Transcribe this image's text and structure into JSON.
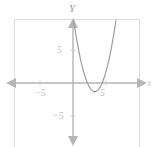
{
  "figure": {
    "kind": "coordinate-plane-parabola",
    "frame_color": "#dcdcdc",
    "axis_color": "#b5b5b5",
    "curve_color": "#9e9e9e",
    "label_color": "#c2c2c2",
    "background": "#ffffff"
  },
  "axes": {
    "y_axis_name": "Y",
    "x_axis_name": "x",
    "x_ticks": [
      {
        "value": -5,
        "label": "−5"
      },
      {
        "value": 5,
        "label": "5"
      }
    ],
    "y_ticks": [
      {
        "value": -5,
        "label": "−5"
      },
      {
        "value": 5,
        "label": "5"
      }
    ]
  },
  "chart_data": {
    "type": "line",
    "title": "",
    "xlabel": "x",
    "ylabel": "Y",
    "xlim": [
      -9,
      11
    ],
    "ylim": [
      -9.5,
      9.5
    ],
    "grid": false,
    "legend": null,
    "series": [
      {
        "name": "parabola",
        "equation": "y = 1.05(x - 3.3)^2 - 1.3",
        "vertex": [
          3.3,
          -1.3
        ],
        "opens": "up",
        "x": [
          0.0,
          0.4,
          0.8,
          1.2,
          1.6,
          2.0,
          2.4,
          2.8,
          3.3,
          3.8,
          4.2,
          4.6,
          5.0,
          5.4,
          5.8,
          6.2,
          6.6
        ],
        "y": [
          10.13,
          8.21,
          6.49,
          4.98,
          3.67,
          2.57,
          1.67,
          0.97,
          -1.3,
          -1.04,
          -0.45,
          0.07,
          1.56,
          3.06,
          4.77,
          6.69,
          8.81
        ]
      }
    ]
  }
}
